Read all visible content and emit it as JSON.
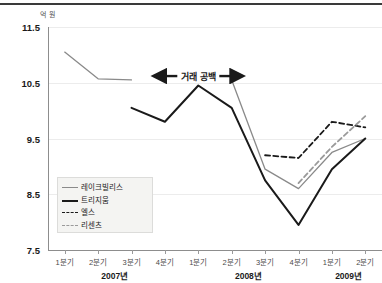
{
  "chart_data": {
    "type": "line",
    "title": "",
    "subtitle": "",
    "unit_label": "억 원",
    "xlabel": "",
    "ylabel": "",
    "ylim": [
      7.5,
      11.5
    ],
    "yticks": [
      "11.5",
      "10.5",
      "9.5",
      "8.5",
      "7.5"
    ],
    "ytick_values": [
      11.5,
      10.5,
      9.5,
      8.5,
      7.5
    ],
    "grid": true,
    "legend_position": "bottom-left",
    "x": [
      "2007년 1분기",
      "2007년 2분기",
      "2007년 3분기",
      "2007년 4분기",
      "2008년 1분기",
      "2008년 2분기",
      "2008년 3분기",
      "2008년 4분기",
      "2009년 1분기",
      "2009년 2분기"
    ],
    "xtick_labels": [
      "1분기",
      "2분기",
      "3분기",
      "4분기",
      "1분기",
      "2분기",
      "3분기",
      "4분기",
      "1분기",
      "2분기"
    ],
    "year_groups": [
      {
        "label": "2007년",
        "start_index": 0,
        "end_index": 3
      },
      {
        "label": "2008년",
        "start_index": 4,
        "end_index": 7
      },
      {
        "label": "2009년",
        "start_index": 8,
        "end_index": 9
      }
    ],
    "series": [
      {
        "name": "레이크빌리스",
        "style": "solid",
        "color": "#8a8a8a",
        "width": 1.3,
        "values": [
          11.05,
          10.57,
          10.55,
          null,
          null,
          10.55,
          8.95,
          8.6,
          9.25,
          9.5
        ]
      },
      {
        "name": "트리지움",
        "style": "solid",
        "color": "#1a1a1a",
        "width": 2.0,
        "values": [
          null,
          null,
          10.05,
          9.8,
          10.45,
          10.05,
          8.75,
          7.95,
          8.95,
          9.5
        ]
      },
      {
        "name": "엘스",
        "style": "dashed",
        "color": "#1a1a1a",
        "width": 1.8,
        "values": [
          null,
          null,
          null,
          null,
          null,
          null,
          9.2,
          9.15,
          9.8,
          9.7
        ]
      },
      {
        "name": "리센츠",
        "style": "dashed",
        "color": "#9a9a9a",
        "width": 1.8,
        "values": [
          null,
          null,
          null,
          null,
          null,
          null,
          null,
          8.7,
          9.35,
          9.9
        ]
      }
    ],
    "annotations": [
      {
        "text": "거래 공백",
        "type": "double-arrow-span",
        "from_x": "2007년 4분기",
        "to_x": "2008년 2분기",
        "y_value": 10.62
      }
    ],
    "legend_entries": [
      {
        "label": "레이크빌리스",
        "style": "solid",
        "color": "#8a8a8a",
        "width": 1.3
      },
      {
        "label": "트리지움",
        "style": "solid",
        "color": "#1a1a1a",
        "width": 2.2
      },
      {
        "label": "엘스",
        "style": "dashed",
        "color": "#1a1a1a",
        "width": 1.8
      },
      {
        "label": "리센츠",
        "style": "dashed",
        "color": "#9a9a9a",
        "width": 1.8
      }
    ]
  }
}
